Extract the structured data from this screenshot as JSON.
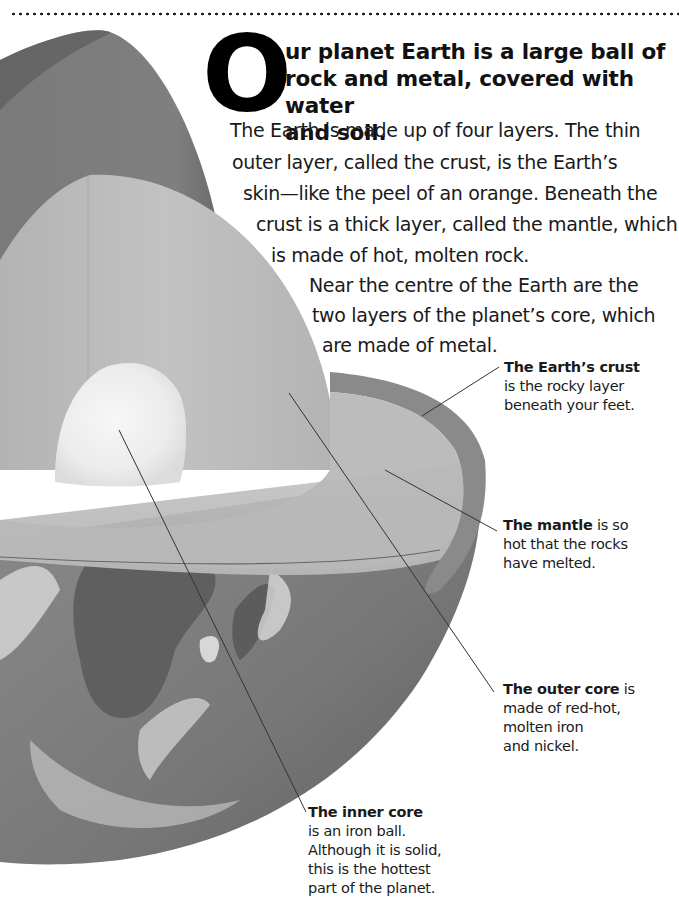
{
  "page": {
    "drop_cap": "O",
    "heading": "ur planet Earth is a large ball of rock and metal, covered with water and soil.",
    "heading_lines": [
      "ur planet Earth is a large ball of",
      "rock and metal, covered with water",
      "and soil."
    ],
    "body_lines": [
      "The Earth is made up of four layers. The thin",
      "outer layer, called the crust, is the Earth’s",
      "skin—like the peel of an orange. Beneath the",
      "crust is a thick layer, called the mantle, which",
      "is made of hot, molten rock.",
      "Near the centre of the Earth are the",
      "two layers of the planet’s core, which",
      "are made of metal."
    ]
  },
  "callouts": {
    "crust": {
      "title": "The Earth’s crust",
      "lines": [
        "is the rocky layer",
        "beneath your feet."
      ]
    },
    "mantle": {
      "title": "The mantle",
      "title_suffix": " is so",
      "lines": [
        "hot that the rocks",
        "have melted."
      ]
    },
    "outer_core": {
      "title": "The outer core",
      "title_suffix": " is",
      "lines": [
        "made of red-hot,",
        "molten iron",
        "and nickel."
      ]
    },
    "inner_core": {
      "title": "The inner core",
      "lines": [
        "is an iron ball.",
        "Although it is solid,",
        "this is the hottest",
        "part of the planet."
      ]
    }
  },
  "illustration": {
    "subject": "cutaway-earth-layers",
    "colors": {
      "crust_outer": "#6e6e6e",
      "crust_rim": "#8a8a8a",
      "mantle": "#b9b9b9",
      "mantle_light": "#c8c8c8",
      "outer_core": "#d2d2d2",
      "inner_core": "#efefef",
      "ocean": "#7c7c7c",
      "land": "#5a5a5a",
      "cloud": "#e6e6e6",
      "leader_line": "#333333"
    }
  }
}
